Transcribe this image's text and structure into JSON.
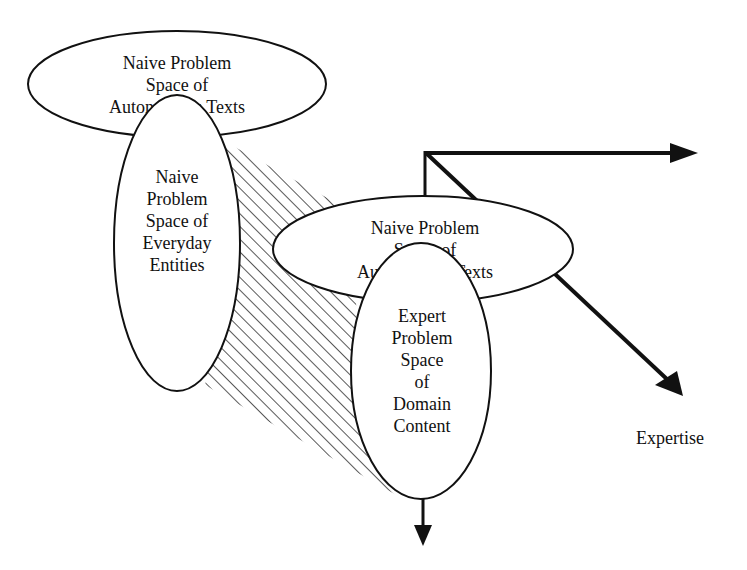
{
  "diagram": {
    "nodes": [
      {
        "id": "naive-autonomous-texts-top",
        "lines": [
          "Naive Problem",
          "Space of",
          "Autonomous Texts"
        ]
      },
      {
        "id": "naive-everyday-entities",
        "lines": [
          "Naive",
          "Problem",
          "Space of",
          "Everyday",
          "Entities"
        ]
      },
      {
        "id": "naive-autonomous-texts-middle",
        "lines": [
          "Naive Problem",
          "Space of",
          "Autonomous Texts"
        ]
      },
      {
        "id": "expert-domain-content",
        "lines": [
          "Expert",
          "Problem",
          "Space",
          "of",
          "Domain",
          "Content"
        ]
      }
    ],
    "axes": {
      "diagonal_label": "Expertise"
    },
    "colors": {
      "stroke": "#111111",
      "background": "#ffffff"
    }
  }
}
